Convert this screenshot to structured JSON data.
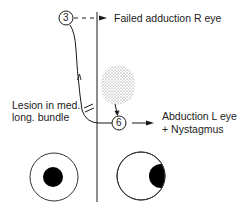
{
  "diagram": {
    "nodes": [
      {
        "id": "n3",
        "label": "3"
      },
      {
        "id": "n6",
        "label": "6"
      }
    ],
    "labels": {
      "failed_adduction": "Failed adduction R eye",
      "lesion_line1": "Lesion in med.",
      "lesion_line2": "long. bundle",
      "abduction_line1": "Abduction L eye",
      "abduction_line2": "+ Nystagmus"
    },
    "eyes": [
      {
        "side": "left",
        "gaze": "center"
      },
      {
        "side": "right",
        "gaze": "right"
      }
    ],
    "colors": {
      "ink": "#1a1a1a",
      "stipple": "#777777",
      "background": "#ffffff"
    }
  }
}
